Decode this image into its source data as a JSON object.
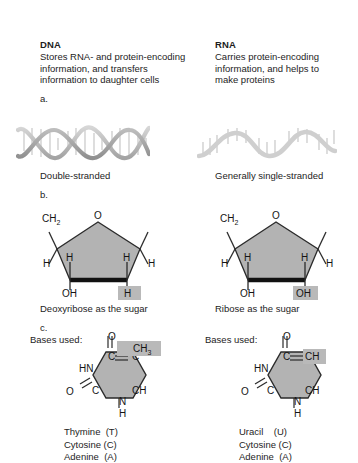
{
  "figure": {
    "kind": "dna-vs-rna-comparison-diagram",
    "background_color": "#ffffff",
    "ring_fill_color": "#b3b3b3",
    "highlight_color": "#b9b9b9",
    "helix_color": "#b0b0b0"
  },
  "columns": {
    "dna": {
      "title": "DNA",
      "description_lines": [
        "Stores RNA- and protein-encoding",
        "information, and transfers",
        "information to daughter cells"
      ],
      "part_label": "a.",
      "strand_caption": "Double-stranded",
      "sugar": {
        "part_label": "b.",
        "caption": "Deoxyribose as the sugar",
        "ring_oxygen": "O",
        "c5_group": "CH",
        "c5_group_sub": "2",
        "left_h": "H",
        "right_h": "H",
        "top_left_h": "H",
        "top_right_h": "H",
        "bottom_left_group": "OH",
        "bottom_right_group": "H",
        "bottom_right_highlighted": true
      },
      "base": {
        "part_label": "c.",
        "bases_label": "Bases used:",
        "ring_atoms": {
          "top_oxygen": "O",
          "c4": "C",
          "hn": "HN",
          "c2": "C",
          "left_oxygen": "O",
          "n1": "N",
          "n1_h": "H",
          "c5": "C",
          "c6": "CH"
        },
        "substituent": "CH",
        "substituent_sub": "3",
        "substituent_highlighted": true,
        "base_list": [
          "Thymine  (T)",
          "Cytosine (C)",
          "Adenine  (A)"
        ]
      }
    },
    "rna": {
      "title": "RNA",
      "description_lines": [
        "Carries protein-encoding",
        "information, and helps to",
        "make proteins"
      ],
      "strand_caption": "Generally single-stranded",
      "sugar": {
        "caption": "Ribose as the sugar",
        "ring_oxygen": "O",
        "c5_group": "CH",
        "c5_group_sub": "2",
        "left_h": "H",
        "right_h": "H",
        "top_left_h": "H",
        "top_right_h": "H",
        "bottom_left_group": "OH",
        "bottom_right_group": "OH",
        "bottom_right_highlighted": true
      },
      "base": {
        "bases_label": "Bases used:",
        "ring_atoms": {
          "top_oxygen": "O",
          "c4": "C",
          "hn": "HN",
          "c2": "C",
          "left_oxygen": "O",
          "n1": "N",
          "n1_h": "H",
          "c5": "CH",
          "c6": "CH"
        },
        "substituent_highlighted": true,
        "base_list": [
          "Uracil    (U)",
          "Cytosine (C)",
          "Adenine  (A)"
        ]
      }
    }
  }
}
